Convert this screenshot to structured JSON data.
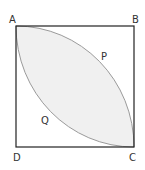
{
  "diagram": {
    "type": "geometry",
    "vertices": [
      {
        "name": "A",
        "label": "A"
      },
      {
        "name": "B",
        "label": "B"
      },
      {
        "name": "C",
        "label": "C"
      },
      {
        "name": "D",
        "label": "D"
      }
    ],
    "regions": [
      {
        "name": "P",
        "label": "P"
      },
      {
        "name": "Q",
        "label": "Q"
      }
    ],
    "colors": {
      "square_stroke": "#222222",
      "arc_stroke": "#9a9a9a",
      "lens_fill": "#f0f0f0",
      "label_color": "#333333"
    }
  }
}
